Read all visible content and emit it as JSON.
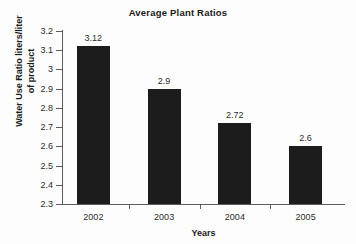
{
  "chart_data": {
    "type": "bar",
    "title": "Average Plant Ratios",
    "xlabel": "Years",
    "ylabel_lines": [
      "Water Use Ratio liters/liter",
      "of product"
    ],
    "ylabel": "Water Use Ratio liters/liter of product",
    "categories": [
      "2002",
      "2003",
      "2004",
      "2005"
    ],
    "values": [
      3.12,
      2.9,
      2.72,
      2.6
    ],
    "value_labels": [
      "3.12",
      "2.9",
      "2.72",
      "2.6"
    ],
    "ylim": [
      2.3,
      3.2
    ],
    "yticks": [
      3.2,
      3.1,
      3,
      2.9,
      2.8,
      2.7,
      2.6,
      2.5,
      2.4,
      2.3
    ],
    "ytick_labels": [
      "3.2",
      "3.1",
      "3",
      "2.9",
      "2.8",
      "2.7",
      "2.6",
      "2.5",
      "2.4",
      "2.3"
    ],
    "grid": false,
    "legend": false,
    "bar_color": "#1c1c1c",
    "axis_color": "#5c5c5c",
    "background": "#fdfdfd"
  }
}
